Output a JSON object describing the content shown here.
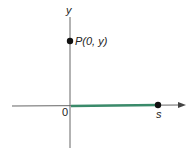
{
  "diagram": {
    "axes": {
      "y_label": "y",
      "origin_label": "0"
    },
    "points": [
      {
        "label": "P(0, y)",
        "x": 0,
        "y": "y"
      },
      {
        "label": "s",
        "x": "s",
        "y": 0
      }
    ],
    "segment": {
      "from": "0",
      "to": "s",
      "color": "#3a8a6a"
    },
    "colors": {
      "axis": "#555555",
      "point": "#111111",
      "segment": "#3a8a6a"
    }
  }
}
